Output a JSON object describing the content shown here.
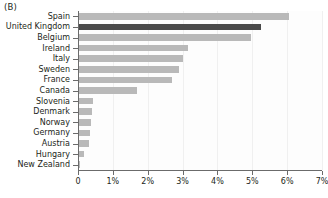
{
  "panel": {
    "label": "(B)"
  },
  "colors": {
    "bar": "#b9b9b9",
    "bar_highlight": "#4a4a4a",
    "axis": "#6b6b6b",
    "gridline": "#f0f0f0",
    "text": "#231f20",
    "background": "#ffffff"
  },
  "chart_data": {
    "type": "bar",
    "orientation": "horizontal",
    "title": "",
    "subtitle": "",
    "xlabel": "",
    "ylabel": "",
    "xlim": [
      0,
      7
    ],
    "xunit": "%",
    "grid": true,
    "legend": null,
    "highlight_category": "United Kingdom",
    "xticks": [
      0,
      1,
      2,
      3,
      4,
      5,
      6,
      7
    ],
    "xticklabels": [
      "0",
      "1%",
      "2%",
      "3%",
      "4%",
      "5%",
      "6%",
      "7%"
    ],
    "categories": [
      "Spain",
      "United Kingdom",
      "Belgium",
      "Ireland",
      "Italy",
      "Sweden",
      "France",
      "Canada",
      "Slovenia",
      "Denmark",
      "Norway",
      "Germany",
      "Austria",
      "Hungary",
      "New Zealand"
    ],
    "values": [
      6.05,
      5.25,
      4.95,
      3.15,
      3.0,
      2.9,
      2.7,
      1.7,
      0.43,
      0.4,
      0.37,
      0.35,
      0.32,
      0.18,
      0.05
    ]
  }
}
